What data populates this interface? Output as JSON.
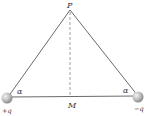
{
  "diagram": {
    "labels": {
      "apex": "P",
      "midpoint": "M",
      "angle_left": "α",
      "angle_right": "α",
      "charge_left": "+q",
      "charge_right": "−q"
    },
    "colors": {
      "line": "#6a6a6a",
      "dashed": "#888888",
      "sphere": "#b5b5b5",
      "text": "#333333"
    }
  }
}
